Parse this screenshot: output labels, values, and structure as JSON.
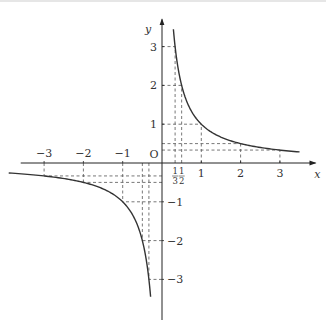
{
  "chart_data": {
    "type": "line",
    "title": "",
    "function": "y = 1/x",
    "xlabel": "x",
    "ylabel": "y",
    "origin_label": "O",
    "xlim": [
      -3.9,
      3.6
    ],
    "ylim": [
      -4.1,
      3.6
    ],
    "grid": false,
    "x_ticks": [
      {
        "value": -3,
        "label": "−3"
      },
      {
        "value": -2,
        "label": "−2"
      },
      {
        "value": -1,
        "label": "−1"
      },
      {
        "value": 1,
        "label": "1"
      },
      {
        "value": 2,
        "label": "2"
      },
      {
        "value": 3,
        "label": "3"
      }
    ],
    "x_fraction_ticks": [
      {
        "value": 0.3333,
        "numerator": "1",
        "denominator": "3"
      },
      {
        "value": 0.5,
        "numerator": "1",
        "denominator": "2"
      }
    ],
    "y_ticks": [
      {
        "value": 3,
        "label": "3"
      },
      {
        "value": 2,
        "label": "2"
      },
      {
        "value": 1,
        "label": "1"
      },
      {
        "value": -1,
        "label": "−1"
      },
      {
        "value": -2,
        "label": "−2"
      },
      {
        "value": -3,
        "label": "−3"
      }
    ],
    "series": [
      {
        "name": "branch-positive",
        "x_range": [
          0.29,
          3.5
        ]
      },
      {
        "name": "branch-negative",
        "x_range": [
          -3.9,
          -0.29
        ]
      }
    ],
    "highlighted_points": [
      {
        "x": 0.3333,
        "y": 3
      },
      {
        "x": 0.5,
        "y": 2
      },
      {
        "x": 1,
        "y": 1
      },
      {
        "x": 2,
        "y": 0.5
      },
      {
        "x": 3,
        "y": 0.3333
      },
      {
        "x": -0.3333,
        "y": -3
      },
      {
        "x": -0.5,
        "y": -2
      },
      {
        "x": -1,
        "y": -1
      },
      {
        "x": -2,
        "y": -0.5
      },
      {
        "x": -3,
        "y": -0.3333
      }
    ]
  }
}
